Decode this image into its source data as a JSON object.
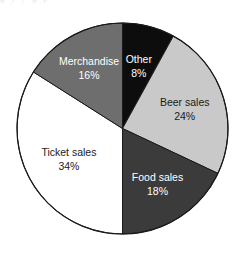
{
  "chart_data": {
    "type": "pie",
    "title": "",
    "subtitle": "",
    "xlabel": "",
    "ylabel": "",
    "legend_position": "none",
    "grid": false,
    "labels_inside_slices": true,
    "start_angle_deg": 0,
    "direction": "clockwise",
    "categories": [
      "Other",
      "Beer sales",
      "Food sales",
      "Ticket sales",
      "Merchandise"
    ],
    "values": [
      8,
      24,
      18,
      34,
      16
    ],
    "value_suffix": "%",
    "slices": [
      {
        "label": "Other",
        "value": 8,
        "value_text": "8%",
        "color": "#0d0d0d",
        "text_color": "#ffffff",
        "start_deg": 0,
        "end_deg": 28.8
      },
      {
        "label": "Beer sales",
        "value": 24,
        "value_text": "24%",
        "color": "#c9c9c9",
        "text_color": "#1a1a1a",
        "start_deg": 28.8,
        "end_deg": 115.2
      },
      {
        "label": "Food sales",
        "value": 18,
        "value_text": "18%",
        "color": "#3b3b3b",
        "text_color": "#ffffff",
        "start_deg": 115.2,
        "end_deg": 180.0
      },
      {
        "label": "Ticket sales",
        "value": 34,
        "value_text": "34%",
        "color": "#ffffff",
        "text_color": "#1a1a1a",
        "start_deg": 180.0,
        "end_deg": 302.4
      },
      {
        "label": "Merchandise",
        "value": 16,
        "value_text": "16%",
        "color": "#6e6e6e",
        "text_color": "#ffffff",
        "start_deg": 302.4,
        "end_deg": 360.0
      }
    ],
    "total": 100,
    "outline_color": "#1a1a1a",
    "background": "#ffffff"
  },
  "ghost_caption": {
    "text": "g      y                  y    g     p"
  }
}
